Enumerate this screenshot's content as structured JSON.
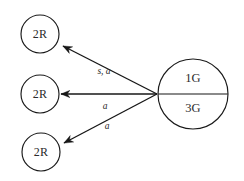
{
  "diagram": {
    "type": "directed-graph",
    "background_color": "#ffffff",
    "stroke_color": "#171717",
    "text_color": "#2b2b2b",
    "nodes": [
      {
        "id": "target-top",
        "label": "2R",
        "shape": "circle",
        "cx": 40,
        "cy": 34,
        "r": 19
      },
      {
        "id": "target-middle",
        "label": "2R",
        "shape": "circle",
        "cx": 40,
        "cy": 94,
        "r": 19
      },
      {
        "id": "target-bottom",
        "label": "2R",
        "shape": "circle",
        "cx": 41,
        "cy": 152,
        "r": 19
      }
    ],
    "source_node": {
      "id": "source-compound",
      "shape": "circle",
      "cx": 193,
      "cy": 94,
      "r": 35,
      "upper_label": "1G",
      "lower_label": "3G",
      "divider": "horizontal"
    },
    "edges": [
      {
        "id": "edge-top",
        "from": "source-compound",
        "to": "target-top",
        "label": "s, a",
        "label_x": 104,
        "label_y": 72,
        "x1": 157,
        "y1": 94,
        "x2": 63,
        "y2": 46
      },
      {
        "id": "edge-middle",
        "from": "source-compound",
        "to": "target-middle",
        "label": "a",
        "label_x": 105,
        "label_y": 107,
        "x1": 157,
        "y1": 94,
        "x2": 61,
        "y2": 94
      },
      {
        "id": "edge-bottom",
        "from": "source-compound",
        "to": "target-bottom",
        "label": "a",
        "label_x": 107,
        "label_y": 127,
        "x1": 157,
        "y1": 94,
        "x2": 64,
        "y2": 143
      }
    ]
  }
}
